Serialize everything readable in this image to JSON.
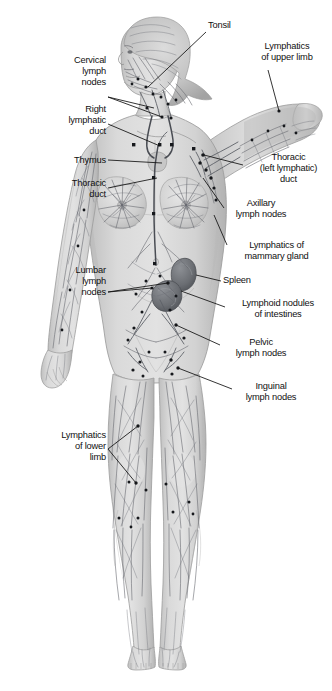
{
  "image": {
    "title": "Lymphatic system of the human body (anterior view, female figure)",
    "background_color": "#ffffff",
    "ink_color": "#111111",
    "body_fill": "#d8d8d8",
    "body_shade": "#b4b4b4",
    "vessel_color": "#5c5f66",
    "node_color": "#16181c",
    "organ_color": "#6f7276",
    "width": 332,
    "height": 691
  },
  "labels": [
    {
      "id": "tonsil",
      "text": "Tonsil",
      "side": "right",
      "align": "left",
      "x": 208,
      "y": 24
    },
    {
      "id": "lymphatics-upper-limb",
      "text": "Lymphatics\nof upper limb",
      "side": "right",
      "align": "left",
      "x": 243,
      "y": 45
    },
    {
      "id": "cervical-lymph-nodes",
      "text": "Cervical\nlymph\nnodes",
      "side": "left",
      "align": "right",
      "x": 44,
      "y": 59,
      "width": 62
    },
    {
      "id": "right-lymphatic-duct",
      "text": "Right\nlymphatic\nduct",
      "side": "left",
      "align": "right",
      "x": 26,
      "y": 108,
      "width": 80
    },
    {
      "id": "thymus",
      "text": "Thymus",
      "side": "left",
      "align": "right",
      "x": 32,
      "y": 153,
      "width": 74
    },
    {
      "id": "thoracic-duct",
      "text": "Thoracic\nduct",
      "side": "left",
      "align": "right",
      "x": 30,
      "y": 177,
      "width": 76
    },
    {
      "id": "thoracic-left-lymphatic-duct",
      "text": "Thoracic\n(left lymphatic)\nduct",
      "side": "right",
      "align": "left",
      "x": 245,
      "y": 155
    },
    {
      "id": "axillary-lymph-nodes",
      "text": "Axillary\nlymph nodes",
      "side": "right",
      "align": "left",
      "x": 226,
      "y": 200
    },
    {
      "id": "lymphatics-mammary-gland",
      "text": "Lymphatics of\nmammary gland",
      "side": "right",
      "align": "left",
      "x": 229,
      "y": 243
    },
    {
      "id": "spleen",
      "text": "Spleen",
      "side": "right",
      "align": "left",
      "x": 223,
      "y": 277
    },
    {
      "id": "lymphoid-nodules-intestines",
      "text": "Lymphoid nodules\nof intestines",
      "side": "right",
      "align": "left",
      "x": 227,
      "y": 301
    },
    {
      "id": "pelvic-lymph-nodes",
      "text": "Pelvic\nlymph nodes",
      "side": "right",
      "align": "left",
      "x": 222,
      "y": 340
    },
    {
      "id": "inguinal-lymph-nodes",
      "text": "Inguinal\nlymph nodes",
      "side": "right",
      "align": "left",
      "x": 234,
      "y": 384
    },
    {
      "id": "lymphatics-lower-limb",
      "text": "Lymphatics\nof lower\nlimb",
      "side": "left",
      "align": "right",
      "x": 24,
      "y": 432,
      "width": 82
    }
  ],
  "leader_lines": [
    {
      "id": "tonsil",
      "points": "206,32 148,87"
    },
    {
      "id": "lymphatics-upper-limb",
      "points": "268,70 279,111"
    },
    {
      "id": "cervical-lymph-nodes-a",
      "points": "108,97 154,108"
    },
    {
      "id": "cervical-lymph-nodes-b",
      "points": "108,97 162,117"
    },
    {
      "id": "right-lymphatic-duct",
      "points": "108,124 160,146"
    },
    {
      "id": "thymus",
      "points": "108,160 162,163"
    },
    {
      "id": "thoracic-duct",
      "points": "108,188 157,178"
    },
    {
      "id": "thoracic-left-lymphatic-duct",
      "points": "243,165 204,155"
    },
    {
      "id": "axillary-lymph-nodes",
      "points": "224,208 203,178"
    },
    {
      "id": "lymphatics-mammary-gland",
      "points": "227,245 214,215"
    },
    {
      "id": "spleen",
      "points": "221,281 196,275"
    },
    {
      "id": "lymphoid-nodules-intestines",
      "points": "225,307 181,291"
    },
    {
      "id": "pelvic-lymph-nodes",
      "points": "220,345 176,325"
    },
    {
      "id": "inguinal-lymph-nodes",
      "points": "232,389 178,368"
    },
    {
      "id": "lumbar-lymph-nodes-a",
      "points": "108,292 168,283"
    },
    {
      "id": "lumbar-lymph-nodes-b",
      "points": "108,292 152,288"
    },
    {
      "id": "lymphatics-lower-limb-a",
      "points": "108,449 138,426"
    },
    {
      "id": "lymphatics-lower-limb-b",
      "points": "108,449 136,483"
    }
  ],
  "extra_labels": [
    {
      "id": "lumbar-lymph-nodes",
      "text": "Lumbar\nlymph\nnodes",
      "side": "left",
      "align": "right",
      "x": 30,
      "y": 269,
      "width": 76
    }
  ],
  "structures": [
    {
      "name": "head",
      "kind": "anatomy"
    },
    {
      "name": "raised-left-arm",
      "kind": "anatomy"
    },
    {
      "name": "right-arm",
      "kind": "anatomy"
    },
    {
      "name": "torso",
      "kind": "anatomy"
    },
    {
      "name": "breasts",
      "kind": "anatomy"
    },
    {
      "name": "legs",
      "kind": "anatomy"
    },
    {
      "name": "feet",
      "kind": "anatomy"
    },
    {
      "name": "spleen",
      "kind": "organ"
    },
    {
      "name": "intestinal-nodules",
      "kind": "organ"
    },
    {
      "name": "thoracic-duct",
      "kind": "vessel"
    },
    {
      "name": "lymphatic-vessel-network",
      "kind": "vessel"
    },
    {
      "name": "lymph-nodes",
      "kind": "node"
    }
  ]
}
